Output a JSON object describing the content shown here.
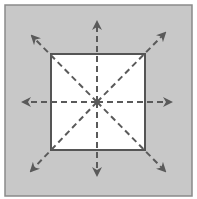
{
  "diagram": {
    "colors": {
      "background": "#ffffff",
      "outer_fill": "#c8c8c8",
      "outer_border": "#8a8a8a",
      "inner_fill": "#ffffff",
      "inner_border": "#555555",
      "arrow": "#5a5a5a"
    },
    "outer_square": {
      "x": 5,
      "y": 5,
      "w": 187,
      "h": 191
    },
    "inner_square": {
      "x": 51,
      "y": 54,
      "w": 94,
      "h": 96
    },
    "center": {
      "x": 97,
      "y": 102
    },
    "arrows": [
      {
        "name": "arrow-up",
        "tip": [
          97,
          22
        ]
      },
      {
        "name": "arrow-down",
        "tip": [
          97,
          175
        ]
      },
      {
        "name": "arrow-left",
        "tip": [
          23,
          102
        ]
      },
      {
        "name": "arrow-right",
        "tip": [
          171,
          102
        ]
      },
      {
        "name": "arrow-up-left",
        "tip": [
          32,
          36
        ]
      },
      {
        "name": "arrow-up-right",
        "tip": [
          165,
          33
        ]
      },
      {
        "name": "arrow-down-left",
        "tip": [
          31,
          171
        ]
      },
      {
        "name": "arrow-down-right",
        "tip": [
          165,
          171
        ]
      }
    ]
  }
}
